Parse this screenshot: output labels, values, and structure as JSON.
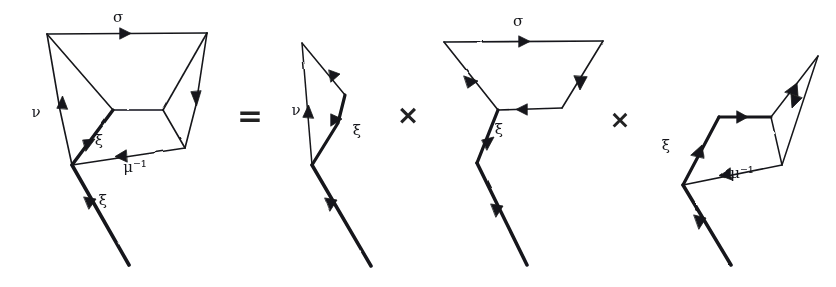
{
  "figure": {
    "kind": "hand-drawn-diagram",
    "equation_reading": "D1 = D2 x D3 x D4",
    "background_color": "#ffffff",
    "ink_color": "#15161a"
  },
  "operators": [
    {
      "name": "equals",
      "glyph": "=",
      "x": 250,
      "y": 126
    },
    {
      "name": "times-1",
      "glyph": "×",
      "x": 408,
      "y": 124
    },
    {
      "name": "times-2",
      "glyph": "×",
      "x": 620,
      "y": 128
    }
  ],
  "panels": [
    {
      "id": "lhs",
      "name": "left-hand-side-diagram",
      "labels": [
        {
          "name": "sigma",
          "text": "σ",
          "x": 118,
          "y": 22
        },
        {
          "name": "nu",
          "text": "ν",
          "x": 36,
          "y": 117
        },
        {
          "name": "xi-upper",
          "text": "ξ",
          "x": 99,
          "y": 145
        },
        {
          "name": "mu-inverse",
          "text": "μ⁻¹",
          "x": 135,
          "y": 166
        },
        {
          "name": "xi-lower",
          "text": "ξ",
          "x": 103,
          "y": 205
        }
      ]
    },
    {
      "id": "factor-1",
      "name": "first-factor-diagram",
      "labels": [
        {
          "name": "nu",
          "text": "ν",
          "x": 296,
          "y": 110
        },
        {
          "name": "xi",
          "text": "ξ",
          "x": 357,
          "y": 132
        }
      ]
    },
    {
      "id": "factor-2",
      "name": "second-factor-diagram",
      "labels": [
        {
          "name": "sigma",
          "text": "σ",
          "x": 518,
          "y": 22
        },
        {
          "name": "xi",
          "text": "ξ",
          "x": 497,
          "y": 131
        }
      ]
    },
    {
      "id": "factor-3",
      "name": "third-factor-diagram",
      "labels": [
        {
          "name": "xi",
          "text": "ξ",
          "x": 665,
          "y": 146
        },
        {
          "name": "mu-inverse",
          "text": "μ⁻¹",
          "x": 740,
          "y": 172
        }
      ]
    }
  ],
  "glyph_map": {
    "sigma": "σ",
    "nu": "ν",
    "xi": "ξ",
    "mu": "μ",
    "mu_inverse": "μ⁻¹",
    "equals": "=",
    "times": "×"
  }
}
